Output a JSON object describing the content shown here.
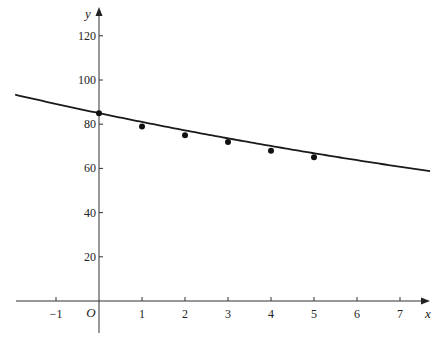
{
  "chart_data": {
    "type": "scatter",
    "title": "",
    "xlabel": "x",
    "ylabel": "y",
    "origin_label": "O",
    "xlim": [
      -1.95,
      7.7
    ],
    "ylim": [
      -14,
      126
    ],
    "x_ticks": [
      -1,
      1,
      2,
      3,
      4,
      5,
      6,
      7
    ],
    "x_tick_labels": [
      "−1",
      "1",
      "2",
      "3",
      "4",
      "5",
      "6",
      "7"
    ],
    "y_ticks": [
      20,
      40,
      60,
      80,
      100,
      120
    ],
    "y_tick_labels": [
      "20",
      "40",
      "60",
      "80",
      "100",
      "120"
    ],
    "grid": false,
    "series": [
      {
        "name": "data points",
        "type": "scatter",
        "x": [
          0,
          1,
          2,
          3,
          4,
          5
        ],
        "y": [
          85,
          79,
          75,
          72,
          68,
          65
        ]
      },
      {
        "name": "fitted curve",
        "type": "line",
        "model": "y = 85 e^(-0.048x)",
        "a": 85,
        "k": -0.048,
        "x_range": [
          -1.95,
          7.7
        ]
      }
    ],
    "legend": "none"
  }
}
